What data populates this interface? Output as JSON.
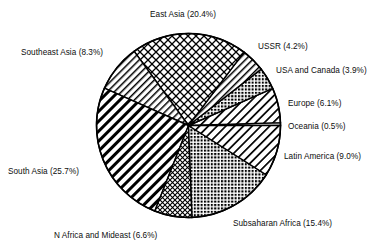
{
  "chart_data": {
    "type": "pie",
    "title": "",
    "subtitle": "",
    "xlabel": "",
    "ylabel": "",
    "legend_position": "none",
    "grid": false,
    "label_format": "{name} ({value}%)",
    "start_angle_deg": 0,
    "direction": "counterclockwise",
    "categories": [
      "Oceania",
      "Europe",
      "USA and Canada",
      "USSR",
      "East Asia",
      "Southeast Asia",
      "South Asia",
      "N Africa and Mideast",
      "Subsaharan Africa",
      "Latin America"
    ],
    "values": [
      0.5,
      6.1,
      3.9,
      4.2,
      20.4,
      8.3,
      25.7,
      6.6,
      15.4,
      9.0
    ],
    "slices": [
      {
        "name": "Oceania",
        "value": 0.5,
        "value_text": "0.5%",
        "label": "Oceania (0.5%)",
        "pattern": "solid-sliver",
        "label_anchor": "right"
      },
      {
        "name": "Europe",
        "value": 6.1,
        "value_text": "6.1%",
        "label": "Europe (6.1%)",
        "pattern": "diagonal-hatch-medium",
        "label_anchor": "right"
      },
      {
        "name": "USA and Canada",
        "value": 3.9,
        "value_text": "3.9%",
        "label": "USA and Canada (3.9%)",
        "pattern": "dotted-grid-dense",
        "label_anchor": "right"
      },
      {
        "name": "USSR",
        "value": 4.2,
        "value_text": "4.2%",
        "label": "USSR (4.2%)",
        "pattern": "diagonal-hatch-fine",
        "label_anchor": "right"
      },
      {
        "name": "East Asia",
        "value": 20.4,
        "value_text": "20.4%",
        "label": "East Asia (20.4%)",
        "pattern": "crosshatch-wide",
        "label_anchor": "top"
      },
      {
        "name": "Southeast Asia",
        "value": 8.3,
        "value_text": "8.3%",
        "label": "Southeast Asia (8.3%)",
        "pattern": "diagonal-hatch-fine",
        "label_anchor": "left"
      },
      {
        "name": "South Asia",
        "value": 25.7,
        "value_text": "25.7%",
        "label": "South Asia (25.7%)",
        "pattern": "diagonal-hatch-bold",
        "label_anchor": "left"
      },
      {
        "name": "N Africa and Mideast",
        "value": 6.6,
        "value_text": "6.6%",
        "label": "N Africa and Mideast (6.6%)",
        "pattern": "crosshatch-fine",
        "label_anchor": "bottom"
      },
      {
        "name": "Subsaharan Africa",
        "value": 15.4,
        "value_text": "15.4%",
        "label": "Subsaharan Africa (15.4%)",
        "pattern": "dotted-grid-dense",
        "label_anchor": "bottom-right"
      },
      {
        "name": "Latin America",
        "value": 9.0,
        "value_text": "9.0%",
        "label": "Latin America (9.0%)",
        "pattern": "diagonal-hatch-medium",
        "label_anchor": "right"
      }
    ]
  },
  "style": {
    "stroke_color": "#000000",
    "fill_color": "#ffffff",
    "background": "#ffffff",
    "text_color": "#0d0d0d"
  }
}
